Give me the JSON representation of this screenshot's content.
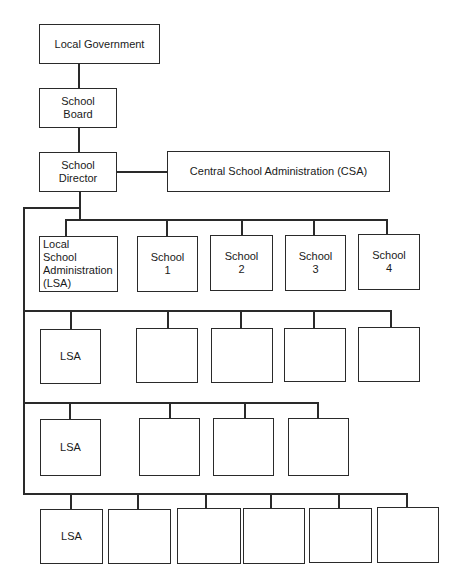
{
  "diagram": {
    "type": "org-chart",
    "top": {
      "local_government": "Local Government",
      "school_board": "School\nBoard",
      "school_director": "School\nDirector",
      "csa": "Central School Administration (CSA)"
    },
    "rows": [
      {
        "lsa": "Local\nSchool\nAdministration\n(LSA)",
        "schools": [
          "School\n1",
          "School\n2",
          "School\n3",
          "School\n4"
        ]
      },
      {
        "lsa": "LSA",
        "schools": [
          "",
          "",
          "",
          ""
        ]
      },
      {
        "lsa": "LSA",
        "schools": [
          "",
          "",
          ""
        ]
      },
      {
        "lsa": "LSA",
        "schools": [
          "",
          "",
          "",
          "",
          ""
        ]
      }
    ]
  }
}
